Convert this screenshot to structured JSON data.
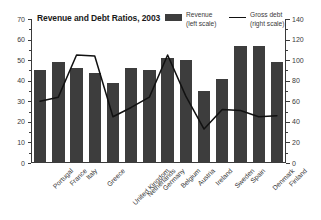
{
  "title": "Revenue and Debt Ratios, 2003",
  "legend": {
    "revenue": {
      "name": "Revenue",
      "scale": "(left scale)",
      "color": "#3d3d3d",
      "marker": "bar-swatch"
    },
    "gross_debt": {
      "name": "Gross debt",
      "scale": "(right scale)",
      "color": "#111111",
      "marker": "line-swatch"
    }
  },
  "left_axis": {
    "ticks": [
      0,
      10,
      20,
      30,
      40,
      50,
      60,
      70
    ],
    "minor_ticks": [
      5,
      15,
      25,
      35,
      45,
      55,
      65
    ],
    "min": 0,
    "max": 70
  },
  "right_axis": {
    "ticks": [
      0,
      20,
      40,
      60,
      80,
      100,
      120,
      140
    ],
    "minor_ticks": [
      10,
      30,
      50,
      70,
      90,
      110,
      130
    ],
    "min": 0,
    "max": 140
  },
  "chart_data": {
    "type": "bar",
    "title": "Revenue and Debt Ratios, 2003",
    "xlabel": "",
    "ylabel": "",
    "ylim": [
      0,
      70
    ],
    "y2lim": [
      0,
      140
    ],
    "grid": false,
    "legend_position": "top-right",
    "categories": [
      "Portugal",
      "France",
      "Italy",
      "Greece",
      "United Kingdom",
      "Netherlands",
      "Germany",
      "Belgium",
      "Austria",
      "Ireland",
      "Sweden",
      "Spain",
      "Denmark",
      "Finland"
    ],
    "series": [
      {
        "name": "Revenue",
        "type": "bar",
        "axis": "left",
        "unit": "percent of GDP",
        "color": "#3d3d3d",
        "values": [
          45,
          49,
          46,
          44,
          39,
          46,
          45,
          51,
          50,
          35,
          41,
          57,
          57,
          49
        ]
      },
      {
        "name": "Gross debt",
        "type": "line",
        "axis": "right",
        "unit": "percent of GDP",
        "color": "#111111",
        "values": [
          60,
          64,
          105,
          104,
          45,
          54,
          64,
          105,
          65,
          33,
          52,
          51,
          45,
          46
        ]
      }
    ]
  }
}
